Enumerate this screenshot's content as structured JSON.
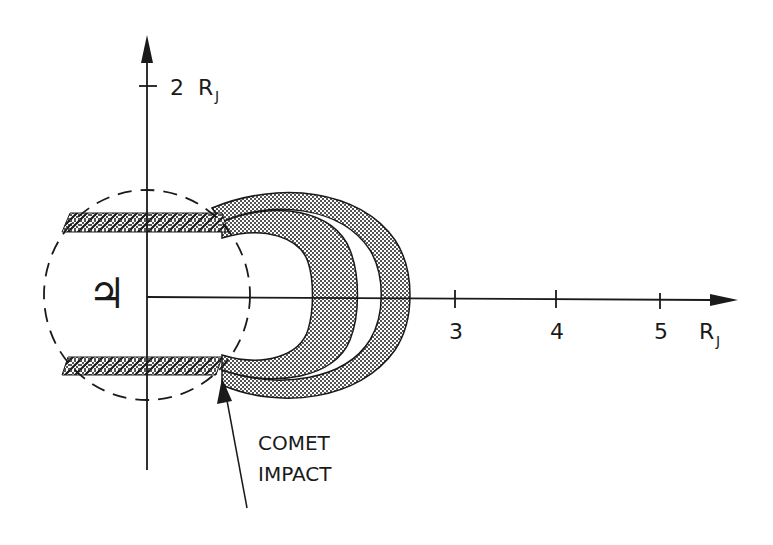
{
  "diagram": {
    "y_axis": {
      "tick_label": "2",
      "unit": "R",
      "unit_sub": "J"
    },
    "x_axis": {
      "ticks": [
        {
          "label": "3",
          "x": 455
        },
        {
          "label": "4",
          "x": 556
        },
        {
          "label": "5",
          "x": 660
        }
      ],
      "unit": "R",
      "unit_sub": "J"
    },
    "planet_symbol": "♃",
    "annotation": {
      "line1": "COMET",
      "line2": "IMPACT"
    },
    "colors": {
      "ink": "#1a1a1a",
      "background": "#ffffff"
    }
  }
}
